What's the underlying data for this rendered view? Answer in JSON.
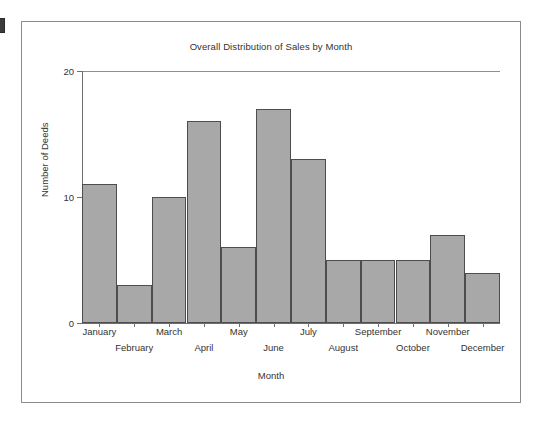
{
  "chart_data": {
    "type": "bar",
    "title": "Overall Distribution of Sales by Month",
    "xlabel": "Month",
    "ylabel": "Number of Deeds",
    "categories": [
      "January",
      "February",
      "March",
      "April",
      "May",
      "June",
      "July",
      "August",
      "September",
      "October",
      "November",
      "December"
    ],
    "values": [
      11,
      3,
      10,
      16,
      6,
      17,
      13,
      5,
      5,
      5,
      7,
      4
    ],
    "ylim": [
      0,
      20
    ],
    "yticks": [
      0,
      10,
      20
    ],
    "ytick_labels": [
      "0",
      "10",
      "20"
    ],
    "grid": false,
    "legend": false,
    "legend_position": "none",
    "bar_fill_color": "#a8a8a8",
    "bar_edge_color": "#4d4d4d",
    "axis_color": "#6f6f6f",
    "text_color": "#333333",
    "frame_color": "#8a8a8a",
    "background_color": "#ffffff",
    "xtick_label_layout": "staggered-two-rows"
  }
}
